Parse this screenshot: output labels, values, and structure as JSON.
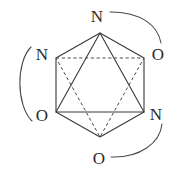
{
  "figure": {
    "name": "octahedral-coordination-diagram",
    "background_color": "#ffffff",
    "line_color": "#3a3a3a",
    "dashed_line_color": "#4a4a4a",
    "label_color": "#2a2a2a",
    "geometry": {
      "center": [
        100,
        85
      ],
      "hexagon_vertices": [
        {
          "id": "v-top",
          "x": 100,
          "y": 33
        },
        {
          "id": "v-upper-right",
          "x": 144,
          "y": 58
        },
        {
          "id": "v-lower-right",
          "x": 144,
          "y": 112
        },
        {
          "id": "v-bottom",
          "x": 100,
          "y": 137
        },
        {
          "id": "v-lower-left",
          "x": 56,
          "y": 112
        },
        {
          "id": "v-upper-left",
          "x": 56,
          "y": 58
        }
      ],
      "solid_triangle": [
        "v-top",
        "v-lower-left",
        "v-lower-right"
      ],
      "dashed_triangle": [
        "v-bottom",
        "v-upper-left",
        "v-upper-right"
      ]
    },
    "labels": [
      {
        "id": "label-top",
        "text": "N",
        "x": 97,
        "y": 16,
        "vertex": "v-top"
      },
      {
        "id": "label-upper-left",
        "text": "N",
        "x": 42,
        "y": 54,
        "vertex": "v-upper-left"
      },
      {
        "id": "label-upper-right",
        "text": "O",
        "x": 158,
        "y": 54,
        "vertex": "v-upper-right"
      },
      {
        "id": "label-lower-left",
        "text": "O",
        "x": 42,
        "y": 115,
        "vertex": "v-lower-left"
      },
      {
        "id": "label-lower-right",
        "text": "N",
        "x": 156,
        "y": 114,
        "vertex": "v-lower-right"
      },
      {
        "id": "label-bottom",
        "text": "O",
        "x": 99,
        "y": 158,
        "vertex": "v-bottom"
      }
    ],
    "bridge_arcs": [
      {
        "id": "arc-left",
        "from": "label-upper-left",
        "to": "label-lower-left",
        "path": "M 31 47 C 16 62 16 105 32 121"
      },
      {
        "id": "arc-top-right",
        "from": "label-top",
        "to": "label-upper-right",
        "path": "M 110 12 C 142 12 158 26 161 43"
      },
      {
        "id": "arc-bottom-right",
        "from": "label-lower-right",
        "to": "label-bottom",
        "path": "M 162 124 C 160 143 140 158 111 157"
      }
    ]
  }
}
